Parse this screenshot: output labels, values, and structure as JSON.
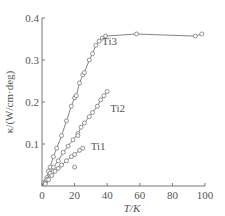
{
  "chart_data": {
    "type": "line",
    "title": "",
    "xlabel": "T/K",
    "ylabel": "κ/(W/cm·deg)",
    "xlim": [
      0,
      100
    ],
    "ylim": [
      0,
      0.4
    ],
    "xticks": [
      0,
      20,
      40,
      60,
      80,
      100
    ],
    "yticks": [
      0.1,
      0.2,
      0.3,
      0.4
    ],
    "xtick_labels": [
      "0",
      "20",
      "40",
      "60",
      "80",
      "100"
    ],
    "ytick_labels": [
      "0.1",
      "0.2",
      "0.3",
      "0.4"
    ],
    "grid": false,
    "legend": "inline labels",
    "series": [
      {
        "name": "Ti3",
        "label_pos": {
          "x": 35,
          "y": 0.345
        },
        "points": [
          [
            2,
            0.01
          ],
          [
            3,
            0.02
          ],
          [
            4,
            0.035
          ],
          [
            5,
            0.045
          ],
          [
            7,
            0.07
          ],
          [
            9,
            0.09
          ],
          [
            12,
            0.12
          ],
          [
            15,
            0.155
          ],
          [
            18,
            0.19
          ],
          [
            20,
            0.21
          ],
          [
            21,
            0.215
          ],
          [
            23,
            0.245
          ],
          [
            25,
            0.265
          ],
          [
            26,
            0.27
          ],
          [
            29,
            0.3
          ],
          [
            31,
            0.315
          ],
          [
            33,
            0.335
          ],
          [
            35,
            0.345
          ],
          [
            37,
            0.352
          ],
          [
            39,
            0.357
          ],
          [
            58,
            0.362
          ],
          [
            94,
            0.357
          ],
          [
            98,
            0.362
          ]
        ]
      },
      {
        "name": "Ti2",
        "label_pos": {
          "x": 40,
          "y": 0.185
        },
        "points": [
          [
            2,
            0.008
          ],
          [
            3,
            0.015
          ],
          [
            5,
            0.03
          ],
          [
            7,
            0.045
          ],
          [
            10,
            0.06
          ],
          [
            13,
            0.08
          ],
          [
            16,
            0.095
          ],
          [
            19,
            0.11
          ],
          [
            22,
            0.125
          ],
          [
            24,
            0.14
          ],
          [
            26,
            0.15
          ],
          [
            29,
            0.165
          ],
          [
            31,
            0.175
          ],
          [
            34,
            0.19
          ],
          [
            36,
            0.205
          ],
          [
            38,
            0.215
          ],
          [
            40,
            0.225
          ]
        ]
      },
      {
        "name": "Ti1",
        "label_pos": {
          "x": 28,
          "y": 0.095
        },
        "points": [
          [
            2,
            0.005
          ],
          [
            4,
            0.015
          ],
          [
            6,
            0.025
          ],
          [
            8,
            0.035
          ],
          [
            10,
            0.042
          ],
          [
            12,
            0.05
          ],
          [
            15,
            0.06
          ],
          [
            18,
            0.07
          ],
          [
            20,
            0.075
          ],
          [
            23,
            0.085
          ],
          [
            25,
            0.09
          ]
        ],
        "outliers": [
          [
            20,
            0.045
          ],
          [
            22,
            0.12
          ]
        ]
      }
    ]
  }
}
